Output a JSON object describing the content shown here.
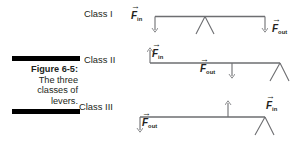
{
  "figure": {
    "caption_title": "Figure 6-5:",
    "caption_lines": [
      "The three",
      "classes of",
      "levers."
    ],
    "rule_color": "#000000",
    "line_color": "#6d6e71"
  },
  "classes": [
    {
      "id": "class-1",
      "label": "Class I",
      "fulcrum_position": "middle",
      "forces": [
        {
          "name": "input",
          "symbol": "F",
          "subscript": "in",
          "direction": "down",
          "position": "left-end"
        },
        {
          "name": "output",
          "symbol": "F",
          "subscript": "out",
          "direction": "down",
          "position": "right-end"
        }
      ]
    },
    {
      "id": "class-2",
      "label": "Class II",
      "fulcrum_position": "right-end",
      "forces": [
        {
          "name": "input",
          "symbol": "F",
          "subscript": "in",
          "direction": "up",
          "position": "left-end"
        },
        {
          "name": "output",
          "symbol": "F",
          "subscript": "out",
          "direction": "down",
          "position": "middle"
        }
      ]
    },
    {
      "id": "class-3",
      "label": "Class III",
      "fulcrum_position": "right-end",
      "forces": [
        {
          "name": "input",
          "symbol": "F",
          "subscript": "in",
          "direction": "up",
          "position": "middle"
        },
        {
          "name": "output",
          "symbol": "F",
          "subscript": "out",
          "direction": "down",
          "position": "left-end"
        }
      ]
    }
  ],
  "labels": {
    "vector_arrow": "→",
    "f_in_symbol": "F",
    "f_in_sub": "in",
    "f_out_symbol": "F",
    "f_out_sub": "out"
  }
}
